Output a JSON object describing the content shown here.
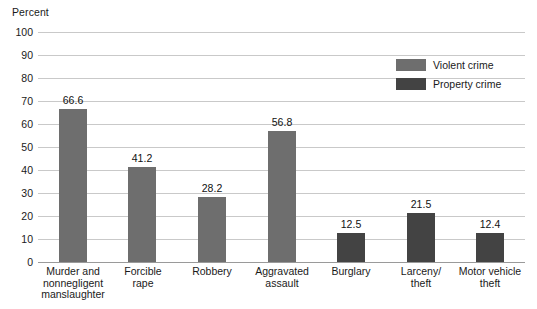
{
  "chart_data": {
    "type": "bar",
    "title": "",
    "xlabel": "",
    "ylabel": "Percent",
    "ylim": [
      0,
      100
    ],
    "ytick_step": 10,
    "grid": true,
    "legend_position": "top-right",
    "y_ticks": [
      "100",
      "90",
      "80",
      "70",
      "60",
      "50",
      "40",
      "30",
      "20",
      "10",
      "0"
    ],
    "categories": [
      "Murder and nonnegligent manslaughter",
      "Forcible rape",
      "Robbery",
      "Aggravated assault",
      "Burglary",
      "Larceny/ theft",
      "Motor vehicle theft"
    ],
    "category_lines": [
      [
        "Murder and",
        "nonnegligent",
        "manslaughter"
      ],
      [
        "Forcible",
        "rape"
      ],
      [
        "Robbery"
      ],
      [
        "Aggravated",
        "assault"
      ],
      [
        "Burglary"
      ],
      [
        "Larceny/",
        "theft"
      ],
      [
        "Motor vehicle",
        "theft"
      ]
    ],
    "values": [
      66.6,
      41.2,
      28.2,
      56.8,
      12.5,
      21.5,
      12.4
    ],
    "value_labels": [
      "66.6",
      "41.2",
      "28.2",
      "56.8",
      "12.5",
      "21.5",
      "12.4"
    ],
    "series_of_bar": [
      "Violent crime",
      "Violent crime",
      "Violent crime",
      "Violent crime",
      "Property crime",
      "Property crime",
      "Property crime"
    ],
    "series": [
      {
        "name": "Violent crime",
        "color": "#6e6e6e"
      },
      {
        "name": "Property crime",
        "color": "#434343"
      }
    ]
  },
  "legend": {
    "items": [
      {
        "label": "Violent crime",
        "color": "#6e6e6e"
      },
      {
        "label": "Property crime",
        "color": "#434343"
      }
    ]
  },
  "colors": {
    "violent_crime": "#6e6e6e",
    "property_crime": "#434343",
    "gridline": "#c9c9c9",
    "baseline": "#9a9a9a",
    "text": "#1a1a1a",
    "background": "#ffffff"
  }
}
